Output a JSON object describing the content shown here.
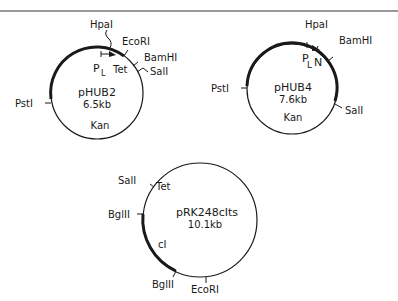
{
  "figure": {
    "border_color": "#333333",
    "ink_color": "#1a1a1a"
  },
  "plasmids": [
    {
      "name": "pHUB2",
      "size": "6.5kb",
      "genes": {
        "promoter": "P",
        "promoter_sub": "L",
        "tet": "Tet",
        "kan": "Kan"
      },
      "sites": {
        "hpa": "HpaI",
        "eco": "EcoRI",
        "bam": "BamHI",
        "sal": "SalI",
        "pst": "PstI"
      }
    },
    {
      "name": "pHUB4",
      "size": "7.6kb",
      "genes": {
        "promoter": "P",
        "promoter_sub": "L",
        "n": "N",
        "kan": "Kan"
      },
      "sites": {
        "hpa": "HpaI",
        "bam": "BamHI",
        "pst": "PstI",
        "sal": "SalI"
      }
    },
    {
      "name": "pRK248cIts",
      "size": "10.1kb",
      "genes": {
        "tet": "Tet",
        "ci": "cI"
      },
      "sites": {
        "sal": "SalI",
        "bgl1": "BglII",
        "bgl2": "BglII",
        "eco": "EcoRI"
      }
    }
  ]
}
